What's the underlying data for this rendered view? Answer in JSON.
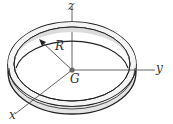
{
  "figure": {
    "labels": {
      "z_axis": "z",
      "y_axis": "y",
      "x_axis": "x",
      "radius": "R",
      "center": "G"
    },
    "colors": {
      "outline": "#222222",
      "band_fill": "#e4e4e4",
      "axis": "#555555",
      "center_dot": "#666666"
    }
  }
}
